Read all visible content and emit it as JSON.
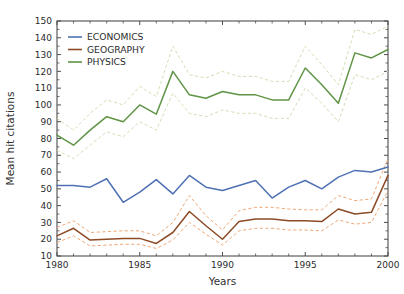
{
  "chart_data": {
    "type": "line",
    "title": "",
    "xlabel": "Years",
    "ylabel": "Mean hit citations",
    "xlim": [
      1980,
      2000
    ],
    "ylim": [
      10,
      150
    ],
    "xticks": [
      1980,
      1985,
      1990,
      1995,
      2000
    ],
    "xtick_labels": [
      "1980",
      "1985",
      "1990",
      "1995",
      "2000"
    ],
    "xminor_step": 1,
    "yticks": [
      10,
      20,
      30,
      40,
      50,
      60,
      70,
      80,
      90,
      100,
      110,
      120,
      130,
      140,
      150
    ],
    "ytick_labels": [
      "10",
      "20",
      "30",
      "40",
      "50",
      "60",
      "70",
      "80",
      "90",
      "100",
      "110",
      "120",
      "130",
      "140",
      "150"
    ],
    "grid": false,
    "legend_position": "upper left",
    "x": [
      1980,
      1981,
      1982,
      1983,
      1984,
      1985,
      1986,
      1987,
      1988,
      1989,
      1990,
      1991,
      1992,
      1993,
      1994,
      1995,
      1996,
      1997,
      1998,
      1999,
      2000
    ],
    "series": [
      {
        "name": "ECONOMICS",
        "label": "ECONOMICS",
        "color": "#4f71b4",
        "values": [
          52,
          52,
          51,
          56,
          42,
          48,
          55.5,
          47,
          58,
          51,
          49,
          52,
          55,
          44.5,
          51,
          55,
          50,
          57,
          61,
          60,
          63
        ],
        "ci_upper": null,
        "ci_lower": null
      },
      {
        "name": "GEOGRAPHY",
        "label": "GEOGRAPHY",
        "color": "#8c4a25",
        "values": [
          22,
          26.5,
          19.5,
          20,
          20.5,
          20.5,
          17.5,
          24,
          36.5,
          28,
          20,
          30.5,
          32,
          32,
          31,
          31,
          30.5,
          38,
          35,
          36,
          58
        ],
        "ci_upper": [
          27,
          31,
          24,
          24.5,
          25,
          25,
          22,
          30,
          46,
          34,
          25.5,
          37,
          39,
          39,
          38,
          37.5,
          37.5,
          46,
          43,
          44,
          68
        ],
        "ci_lower": [
          18,
          22,
          16,
          16.5,
          17,
          17,
          14.5,
          19.5,
          30,
          23,
          16.5,
          25,
          26.5,
          26.5,
          25.5,
          25.5,
          25,
          31.5,
          29,
          30,
          49
        ],
        "ci_color": "#f0a878"
      },
      {
        "name": "PHYSICS",
        "label": "PHYSICS",
        "color": "#5f9446",
        "values": [
          82,
          76,
          85,
          93,
          90,
          100,
          94.5,
          120,
          106,
          104,
          108,
          106,
          106,
          103,
          103,
          122,
          112,
          101,
          131,
          128,
          133
        ],
        "ci_upper": [
          92,
          85,
          95,
          103,
          100,
          111,
          105,
          135,
          118,
          116,
          120,
          117,
          117,
          114,
          114,
          135,
          124,
          112,
          145,
          142,
          147
        ],
        "ci_lower": [
          73,
          68,
          76,
          84,
          81,
          90,
          85,
          107,
          95,
          93,
          97,
          95,
          95,
          92,
          92,
          110,
          101,
          90,
          118,
          115,
          120
        ],
        "ci_color": "#cfe0b4"
      }
    ]
  },
  "legend": {
    "entries": [
      "ECONOMICS",
      "GEOGRAPHY",
      "PHYSICS"
    ]
  },
  "axes": {
    "x_title": "Years",
    "y_title": "Mean hit citations"
  }
}
